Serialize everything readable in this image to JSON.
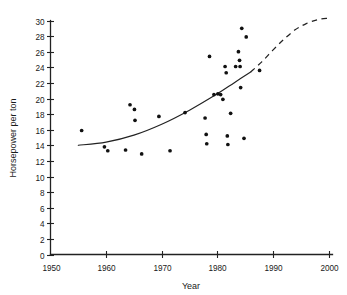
{
  "chart_data": {
    "type": "scatter",
    "title": "",
    "subtitle": "",
    "xlabel": "Year",
    "ylabel": "Horsepower per ton",
    "xlim": [
      1950,
      2000
    ],
    "ylim": [
      0,
      30
    ],
    "grid": false,
    "legend": null,
    "x_ticks": [
      1950,
      1960,
      1970,
      1980,
      1990,
      2000
    ],
    "x_tick_labels": [
      "1950",
      "1960",
      "1970",
      "1980",
      "1990",
      "2000"
    ],
    "y_ticks": [
      0,
      2,
      4,
      6,
      8,
      10,
      12,
      14,
      16,
      18,
      20,
      22,
      24,
      26,
      28,
      30
    ],
    "y_tick_labels": [
      "0",
      "2",
      "4",
      "6",
      "8",
      "10",
      "12",
      "14",
      "16",
      "18",
      "20",
      "22",
      "24",
      "26",
      "28",
      "30"
    ],
    "marker": "filled-circle",
    "marker_color": "#111111",
    "points": [
      {
        "x": 1955.6,
        "y": 15.9
      },
      {
        "x": 1959.7,
        "y": 13.8
      },
      {
        "x": 1960.3,
        "y": 13.3
      },
      {
        "x": 1963.5,
        "y": 13.4
      },
      {
        "x": 1964.3,
        "y": 19.2
      },
      {
        "x": 1965.1,
        "y": 18.6
      },
      {
        "x": 1965.2,
        "y": 17.2
      },
      {
        "x": 1966.4,
        "y": 12.9
      },
      {
        "x": 1969.5,
        "y": 17.7
      },
      {
        "x": 1971.5,
        "y": 13.3
      },
      {
        "x": 1974.2,
        "y": 18.2
      },
      {
        "x": 1977.8,
        "y": 17.5
      },
      {
        "x": 1978.0,
        "y": 15.4
      },
      {
        "x": 1978.1,
        "y": 14.2
      },
      {
        "x": 1978.6,
        "y": 25.4
      },
      {
        "x": 1979.4,
        "y": 20.5
      },
      {
        "x": 1980.1,
        "y": 20.6
      },
      {
        "x": 1980.6,
        "y": 20.5
      },
      {
        "x": 1981.0,
        "y": 19.9
      },
      {
        "x": 1981.4,
        "y": 24.1
      },
      {
        "x": 1981.6,
        "y": 23.3
      },
      {
        "x": 1981.8,
        "y": 15.2
      },
      {
        "x": 1981.9,
        "y": 14.1
      },
      {
        "x": 1982.4,
        "y": 18.1
      },
      {
        "x": 1983.3,
        "y": 24.1
      },
      {
        "x": 1983.8,
        "y": 26.0
      },
      {
        "x": 1984.0,
        "y": 24.9
      },
      {
        "x": 1984.1,
        "y": 24.1
      },
      {
        "x": 1984.2,
        "y": 21.4
      },
      {
        "x": 1984.4,
        "y": 29.0
      },
      {
        "x": 1984.8,
        "y": 14.9
      },
      {
        "x": 1985.2,
        "y": 27.9
      },
      {
        "x": 1987.6,
        "y": 23.6
      }
    ],
    "trend_solid": {
      "label": "fitted trend (observed)",
      "style": "solid",
      "x_range": [
        1955,
        1986
      ],
      "points": [
        {
          "x": 1955.0,
          "y": 14.0
        },
        {
          "x": 1960.0,
          "y": 14.4
        },
        {
          "x": 1965.0,
          "y": 15.3
        },
        {
          "x": 1970.0,
          "y": 16.7
        },
        {
          "x": 1975.0,
          "y": 18.5
        },
        {
          "x": 1980.0,
          "y": 20.6
        },
        {
          "x": 1983.0,
          "y": 22.0
        },
        {
          "x": 1986.0,
          "y": 23.4
        }
      ]
    },
    "trend_dashed": {
      "label": "extrapolated trend (projection)",
      "style": "dashed",
      "x_range": [
        1986,
        2000
      ],
      "points": [
        {
          "x": 1986.0,
          "y": 23.4
        },
        {
          "x": 1988.0,
          "y": 24.7
        },
        {
          "x": 1990.0,
          "y": 26.2
        },
        {
          "x": 1992.0,
          "y": 27.6
        },
        {
          "x": 1994.0,
          "y": 28.8
        },
        {
          "x": 1996.0,
          "y": 29.6
        },
        {
          "x": 1998.0,
          "y": 30.1
        },
        {
          "x": 2000.0,
          "y": 30.3
        }
      ]
    }
  }
}
